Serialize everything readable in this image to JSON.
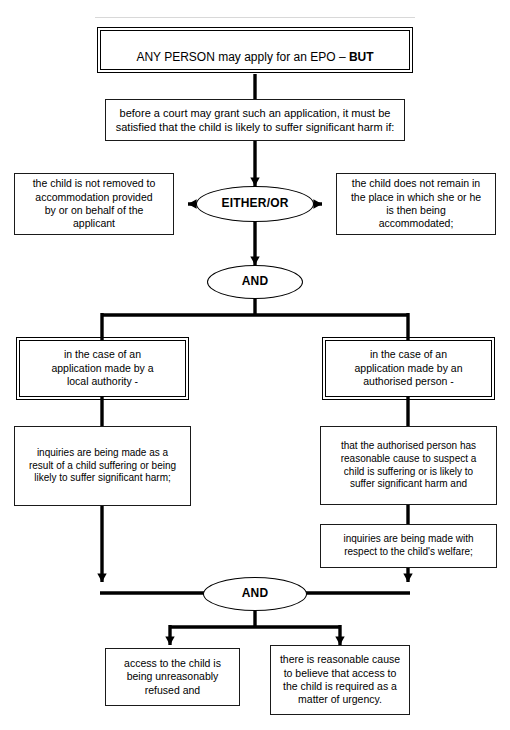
{
  "diagram": {
    "type": "flowchart",
    "nodes": {
      "start": {
        "id": "start",
        "shape": "double-rectangle",
        "text_plain": "ANY PERSON may apply for an EPO – BUT",
        "text_normal": "ANY PERSON may apply for an EPO – ",
        "text_bold": "BUT"
      },
      "condition": {
        "id": "condition",
        "shape": "rectangle",
        "text": "before a court may grant such an application, it must be\nsatisfied that the child is likely to suffer significant harm if:"
      },
      "either_or": {
        "id": "either-or",
        "shape": "ellipse",
        "text": "EITHER/OR"
      },
      "branch_left": {
        "id": "branch-left",
        "shape": "rectangle",
        "text": "the child is not removed to\naccommodation provided\nby or on behalf of the\napplicant"
      },
      "branch_right": {
        "id": "branch-right",
        "shape": "rectangle",
        "text": "the child does not remain in\nthe place in which she or he\nis then being\naccommodated;"
      },
      "and_top": {
        "id": "and-top",
        "shape": "ellipse",
        "text": "AND"
      },
      "local_authority": {
        "id": "local-authority",
        "shape": "double-rectangle",
        "text": "in the case of an\napplication made by a\nlocal authority -"
      },
      "authorised_person": {
        "id": "authorised-person",
        "shape": "double-rectangle",
        "text": "in the case of an\napplication made by an\nauthorised person -"
      },
      "la_inquiries": {
        "id": "la-inquiries",
        "shape": "rectangle",
        "text": "inquiries are being made as a\nresult of a child suffering or being\nlikely to suffer significant harm;"
      },
      "ap_reasonable_cause": {
        "id": "ap-reasonable-cause",
        "shape": "rectangle",
        "text": "that the authorised person has\nreasonable cause to suspect a\nchild is suffering or is likely to\nsuffer significant harm and"
      },
      "ap_inquiries": {
        "id": "ap-inquiries",
        "shape": "rectangle",
        "text": "inquiries are being made with\nrespect to the child's welfare;"
      },
      "and_bottom": {
        "id": "and-bottom",
        "shape": "ellipse",
        "text": "AND"
      },
      "outcome_left": {
        "id": "outcome-left",
        "shape": "rectangle",
        "text": "access to the child is\nbeing unreasonably\nrefused and"
      },
      "outcome_right": {
        "id": "outcome-right",
        "shape": "rectangle",
        "text": "there is reasonable cause\nto believe that access to\nthe child is required as a\nmatter of urgency."
      }
    },
    "colors": {
      "stroke": "#000000",
      "text": "#000000",
      "background": "#ffffff",
      "box_border": "#1a1a1a"
    },
    "edges": [
      {
        "from": "start",
        "to": "condition",
        "arrow": "none"
      },
      {
        "from": "condition",
        "to": "either_or",
        "arrow": "down"
      },
      {
        "from": "either_or",
        "to": "branch_left",
        "arrow": "left"
      },
      {
        "from": "either_or",
        "to": "branch_right",
        "arrow": "right"
      },
      {
        "from": "either_or",
        "to": "and_top",
        "arrow": "down"
      },
      {
        "from": "and_top",
        "to": "local_authority",
        "arrow": "none"
      },
      {
        "from": "and_top",
        "to": "authorised_person",
        "arrow": "none"
      },
      {
        "from": "local_authority",
        "to": "la_inquiries",
        "arrow": "none"
      },
      {
        "from": "authorised_person",
        "to": "ap_reasonable_cause",
        "arrow": "none"
      },
      {
        "from": "ap_reasonable_cause",
        "to": "ap_inquiries",
        "arrow": "none"
      },
      {
        "from": "la_inquiries",
        "to": "and_bottom",
        "arrow": "down-then-right"
      },
      {
        "from": "ap_inquiries",
        "to": "and_bottom",
        "arrow": "down-then-left"
      },
      {
        "from": "and_bottom",
        "to": "outcome_left",
        "arrow": "down"
      },
      {
        "from": "and_bottom",
        "to": "outcome_right",
        "arrow": "down"
      }
    ]
  }
}
